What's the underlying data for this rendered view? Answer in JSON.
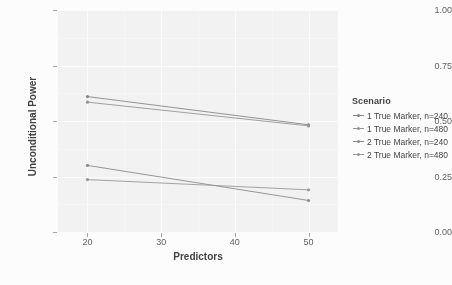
{
  "chart_data": {
    "type": "line",
    "title": "",
    "subtitle": "",
    "xlabel": "Predictors",
    "ylabel": "Unconditional Power",
    "x": [
      20,
      50
    ],
    "xlim": [
      16,
      54
    ],
    "ylim": [
      0.0,
      1.0
    ],
    "xticks": [
      20,
      30,
      40,
      50
    ],
    "xtick_labels": [
      "20",
      "30",
      "40",
      "50"
    ],
    "yticks": [
      0.0,
      0.25,
      0.5,
      0.75,
      1.0
    ],
    "ytick_labels": [
      "0.00",
      "0.25",
      "0.50",
      "0.75",
      "1.00"
    ],
    "grid": true,
    "grid_minor": true,
    "legend_position": "right",
    "legend_title": "Scenario",
    "series": [
      {
        "name": "1 True Marker, n=240",
        "values": [
          0.61,
          0.483
        ],
        "color": "#7b7b7b"
      },
      {
        "name": "1 True Marker, n=480",
        "values": [
          0.585,
          0.478
        ],
        "color": "#8a8a8a"
      },
      {
        "name": "2 True Marker, n=240",
        "values": [
          0.3,
          0.142
        ],
        "color": "#7f7f7f"
      },
      {
        "name": "2 True Marker, n=480",
        "values": [
          0.236,
          0.19
        ],
        "color": "#8e8e8e"
      }
    ]
  },
  "axes": {
    "x_title": "Predictors",
    "y_title": "Unconditional Power"
  },
  "legend": {
    "title": "Scenario",
    "items": [
      {
        "label": "1 True Marker, n=240"
      },
      {
        "label": "1 True Marker, n=480"
      },
      {
        "label": "2 True Marker, n=240"
      },
      {
        "label": "2 True Marker, n=480"
      }
    ]
  },
  "style": {
    "panel_fill": "#ececec",
    "grid_color": "#ffffff",
    "text_color": "#2b2b2b",
    "tick_color": "#4d4d4d"
  }
}
